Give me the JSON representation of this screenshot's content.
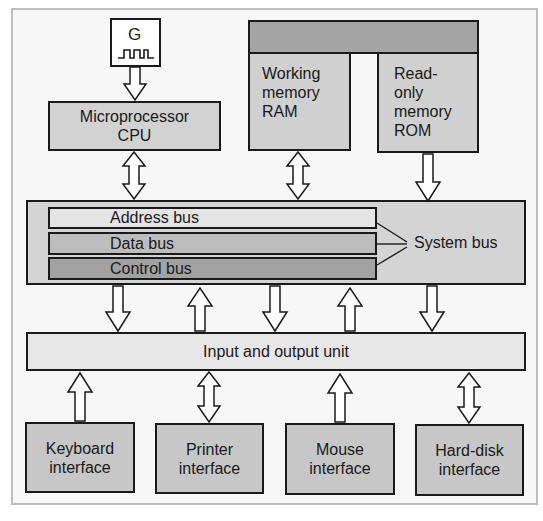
{
  "diagram": {
    "type": "computer-architecture-block-diagram",
    "clock_generator": {
      "label": "G",
      "icon": "clock-pulse-icon"
    },
    "cpu": {
      "line1": "Microprocessor",
      "line2": "CPU"
    },
    "memory": {
      "ram": {
        "line1": "Working",
        "line2": "memory",
        "line3": "RAM"
      },
      "rom": {
        "line1": "Read-",
        "line2": "only",
        "line3": "memory",
        "line4": "ROM"
      }
    },
    "system_bus": {
      "label": "System bus",
      "buses": [
        {
          "label": "Address bus",
          "color": "#e2e2e2"
        },
        {
          "label": "Data bus",
          "color": "#c3c3c3"
        },
        {
          "label": "Control bus",
          "color": "#a6a6a6"
        }
      ]
    },
    "io_unit": {
      "label": "Input and output unit"
    },
    "interfaces": [
      {
        "line1": "Keyboard",
        "line2": "interface",
        "arrow": "up"
      },
      {
        "line1": "Printer",
        "line2": "interface",
        "arrow": "bidirectional"
      },
      {
        "line1": "Mouse",
        "line2": "interface",
        "arrow": "up"
      },
      {
        "line1": "Hard-disk",
        "line2": "interface",
        "arrow": "bidirectional"
      }
    ],
    "bus_to_io_arrows": [
      "down",
      "up",
      "down",
      "up",
      "down"
    ],
    "colors": {
      "frame_border": "#bdbdbd",
      "frame_bg": "#f7f7f7",
      "box_light": "#e2e2e2",
      "box_mid": "#c9c9c9",
      "box_dark": "#a9a9a9",
      "stroke": "#1a1a1a"
    }
  }
}
